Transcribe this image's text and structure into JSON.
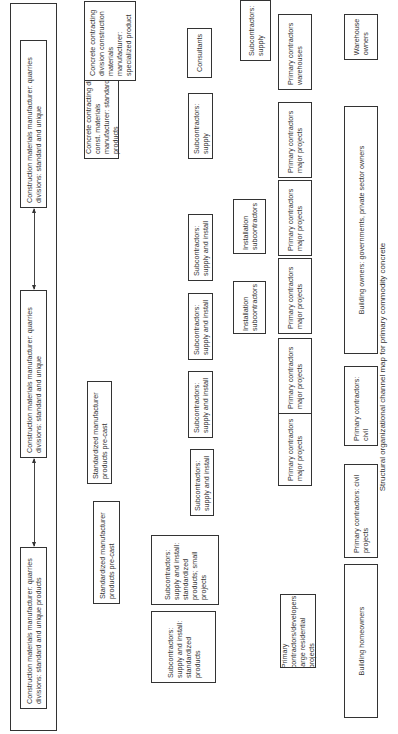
{
  "caption": "Structural organizational channel map for primary commodity concrete",
  "manufacturers": {
    "left": "Construction materials manufacturer: quarries divisions: standard and unique products",
    "middle": "Construction materials manufacturer: quarries divisions: standard and unique",
    "right": "Construction materials manufacturer: quarries divisions: standard and unique"
  },
  "tier1": {
    "std_precast_1": "Standardized manufacturer products pre-cast",
    "std_precast_2": "Standardized manufacturer products pre-cast",
    "concrete_std": "Concrete contracting div. const. materials manufacturer: standard products",
    "concrete_special": "Concrete contracting division construction materials manufacturer: specialized product"
  },
  "tier2": {
    "sub_std_products": "Subcontractors: supply and install: standardized products",
    "sub_std_small": "Subcontractors: supply and install: standardized products; small projects",
    "sub_si_1": "Subcontractors: supply and install",
    "sub_si_2": "Subcontractors: supply and install",
    "sub_si_3": "Subcontractors: supply and install",
    "sub_si_4": "Subcontractors: supply and install",
    "sub_supply_1": "Subcontractors: supply",
    "consultants": "Consultants",
    "sub_supply_2": "Subcontractors: supply"
  },
  "tier3": {
    "install_sub_1": "Installation subcontractors",
    "install_sub_2": "Installation subcontractors"
  },
  "tier4": {
    "primary_dev": "Primary contractors/developers: large residential projects",
    "primary_major_1": "Primary contractors major projects",
    "primary_major_2": "Primary contractors major projects",
    "primary_major_3": "Primary contractors major projects",
    "primary_major_4": "Primary contractors major projects",
    "primary_major_5": "Primary contractors major projects",
    "primary_warehouses": "Primary contractors warehouses"
  },
  "tier5": {
    "homeowners": "Building homeowners",
    "primary_civil_projects": "Primary contractors: civil projects",
    "primary_civil": "Primary contractors: civil",
    "building_owners": "Building owners: governments, private sector owners",
    "warehouse_owners": "Warehouse owners"
  }
}
